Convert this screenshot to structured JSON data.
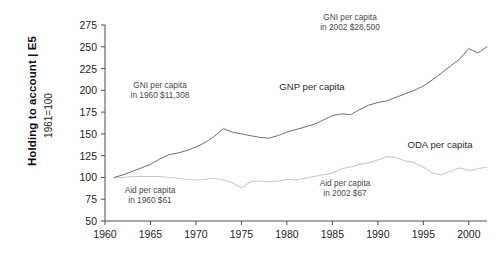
{
  "header": {
    "running_head": "Holding to account | E5"
  },
  "chart_data": {
    "type": "line",
    "title": "",
    "xlabel": "",
    "ylabel": "1961=100",
    "xlim": [
      1960,
      2002
    ],
    "ylim": [
      50,
      275
    ],
    "grid": false,
    "legend_position": "inline-annotations",
    "xticks": [
      1960,
      1965,
      1970,
      1975,
      1980,
      1985,
      1990,
      1995,
      2000
    ],
    "yticks": [
      50,
      75,
      100,
      125,
      150,
      175,
      200,
      225,
      250,
      275
    ],
    "x": [
      1961,
      1962,
      1963,
      1964,
      1965,
      1966,
      1967,
      1968,
      1969,
      1970,
      1971,
      1972,
      1973,
      1974,
      1975,
      1976,
      1977,
      1978,
      1979,
      1980,
      1981,
      1982,
      1983,
      1984,
      1985,
      1986,
      1987,
      1988,
      1989,
      1990,
      1991,
      1992,
      1993,
      1994,
      1995,
      1996,
      1997,
      1998,
      1999,
      2000,
      2001,
      2002
    ],
    "series": [
      {
        "name": "GNP per capita",
        "color": "#6e6e6e",
        "values": [
          100,
          103,
          107,
          111,
          115,
          121,
          126,
          128,
          131,
          135,
          140,
          147,
          156,
          152,
          150,
          148,
          146,
          145,
          148,
          152,
          155,
          158,
          161,
          166,
          171,
          173,
          172,
          178,
          183,
          186,
          188,
          192,
          196,
          200,
          205,
          212,
          220,
          228,
          236,
          248,
          243,
          250
        ]
      },
      {
        "name": "ODA per capita",
        "color": "#c9c9c9",
        "values": [
          100,
          100,
          101,
          101,
          101,
          101,
          100,
          99,
          98,
          97,
          98,
          99,
          97,
          94,
          88,
          95,
          96,
          95,
          96,
          98,
          97,
          99,
          101,
          103,
          105,
          110,
          112,
          115,
          117,
          120,
          124,
          123,
          119,
          117,
          112,
          105,
          103,
          107,
          111,
          108,
          110,
          112
        ]
      }
    ],
    "annotations": [
      {
        "name": "gni-1960-note",
        "text_line1": "GNI per capita",
        "text_line2": "in 1960 $11,308",
        "x_px": 160,
        "y_px": 88,
        "size": "small"
      },
      {
        "name": "gni-2002-note",
        "text_line1": "GNI per capita",
        "text_line2": "in 2002 $28,500",
        "x_px": 350,
        "y_px": 20,
        "size": "small"
      },
      {
        "name": "aid-1960-note",
        "text_line1": "Aid per capita",
        "text_line2": "in 1960 $61",
        "x_px": 150,
        "y_px": 193,
        "size": "small"
      },
      {
        "name": "aid-2002-note",
        "text_line1": "Aid per capita",
        "text_line2": "in 2002 $67",
        "x_px": 345,
        "y_px": 186,
        "size": "small"
      },
      {
        "name": "gnp-series-label",
        "text_line1": "GNP per capita",
        "text_line2": "",
        "x_px": 312,
        "y_px": 90,
        "size": "large"
      },
      {
        "name": "oda-series-label",
        "text_line1": "ODA per capita",
        "text_line2": "",
        "x_px": 440,
        "y_px": 148,
        "size": "large"
      }
    ]
  }
}
